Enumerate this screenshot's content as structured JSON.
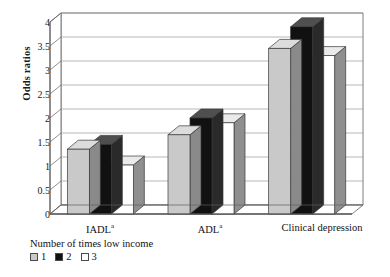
{
  "chart_data": {
    "type": "bar",
    "title": "",
    "subtitle": "",
    "xlabel": "",
    "ylabel": "Odds ratios",
    "ylim": [
      0,
      4
    ],
    "yticks": [
      "0",
      "0.5",
      "1",
      "1.5",
      "2",
      "2.5",
      "3",
      "3.5",
      "4"
    ],
    "ytick_values": [
      0,
      0.5,
      1,
      1.5,
      2,
      2.5,
      3,
      3.5,
      4
    ],
    "grid": true,
    "style": "3d-grouped-columns",
    "categories": [
      "IADL",
      "ADL",
      "Clinical depression"
    ],
    "category_superscripts": [
      "a",
      "a",
      ""
    ],
    "legend_title": "Number of times low income",
    "legend_position": "below-left",
    "series": [
      {
        "name": "1",
        "color": "#c9c9c9",
        "values": [
          1.35,
          1.65,
          3.45
        ]
      },
      {
        "name": "2",
        "color": "#111111",
        "values": [
          1.45,
          2.0,
          3.9
        ]
      },
      {
        "name": "3",
        "color": "#ffffff",
        "values": [
          1.02,
          1.9,
          3.3
        ]
      }
    ]
  },
  "legend": {
    "title": "Number of times low income",
    "entries": [
      {
        "label": "1",
        "swatch": "light-gray"
      },
      {
        "label": "2",
        "swatch": "black"
      },
      {
        "label": "3",
        "swatch": "white"
      }
    ]
  },
  "axis": {
    "y_title": "Odds ratios",
    "y_labels": [
      "4",
      "3.5",
      "3",
      "2.5",
      "2",
      "1.5",
      "1",
      "0.5",
      "0"
    ],
    "x_labels": [
      "IADL",
      "ADL",
      "Clinical depression"
    ],
    "x_superscript": "a"
  },
  "colors": {
    "series1": "#c9c9c9",
    "series2": "#111111",
    "series3": "#ffffff",
    "grid": "#9a9a9a",
    "axis": "#5d5d5d",
    "text": "#15110f"
  }
}
